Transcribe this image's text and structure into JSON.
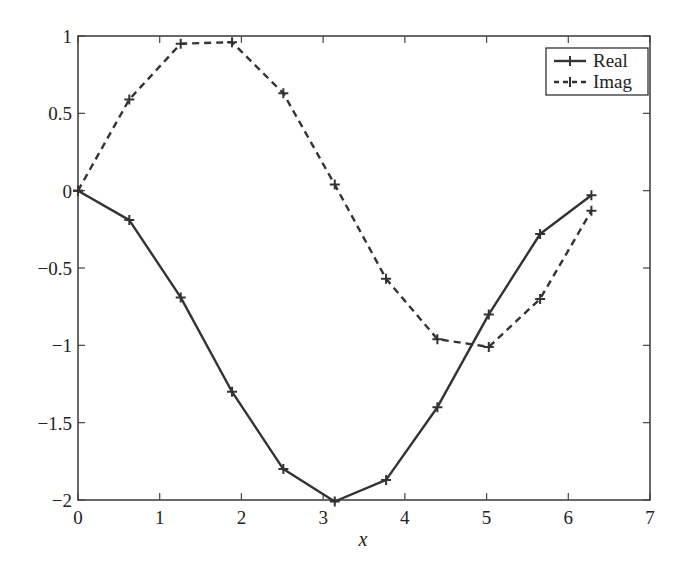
{
  "chart_data": {
    "type": "line",
    "title": "",
    "xlabel": "x",
    "ylabel": "",
    "xlim": [
      0,
      7
    ],
    "ylim": [
      -2,
      1
    ],
    "xticks": [
      0,
      1,
      2,
      3,
      4,
      5,
      6,
      7
    ],
    "yticks": [
      1,
      0.5,
      0,
      -0.5,
      -1,
      -1.5,
      -2
    ],
    "xtick_labels": [
      "0",
      "1",
      "2",
      "3",
      "4",
      "5",
      "6",
      "7"
    ],
    "ytick_labels": [
      "1",
      "0.5",
      "0",
      "−0.5",
      "−1",
      "−1.5",
      "−2"
    ],
    "grid": false,
    "legend_position": "upper right",
    "x": [
      0,
      0.628,
      1.257,
      1.885,
      2.513,
      3.142,
      3.77,
      4.398,
      5.027,
      5.655,
      6.283
    ],
    "series": [
      {
        "name": "Real",
        "style": "solid",
        "marker": "+",
        "color": "#333333",
        "values": [
          0,
          -0.19,
          -0.69,
          -1.3,
          -1.8,
          -2.01,
          -1.87,
          -1.4,
          -0.8,
          -0.28,
          -0.03
        ]
      },
      {
        "name": "Imag",
        "style": "dashed",
        "marker": "+",
        "color": "#333333",
        "values": [
          0,
          0.59,
          0.95,
          0.96,
          0.63,
          0.04,
          -0.57,
          -0.96,
          -1.01,
          -0.7,
          -0.13
        ]
      }
    ]
  },
  "legend": {
    "items": [
      {
        "label": "Real"
      },
      {
        "label": "Imag"
      }
    ]
  }
}
